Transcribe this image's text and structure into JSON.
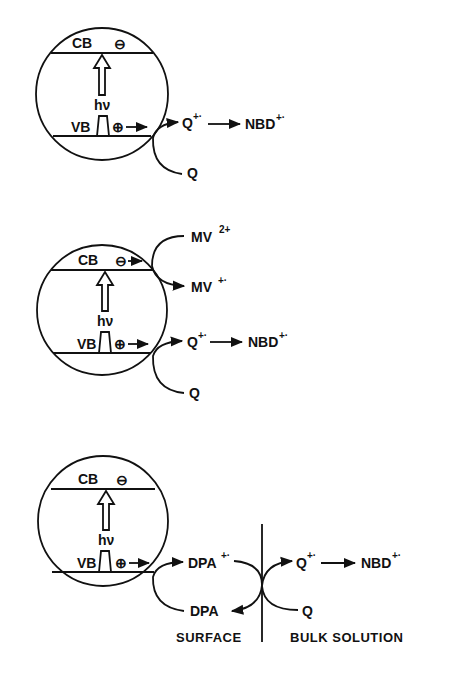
{
  "diagram": {
    "type": "photocatalysis-band-scheme",
    "panels": [
      {
        "id": "panel-1",
        "particle": {
          "cb_label": "CB",
          "vb_label": "VB",
          "electron": "⊖",
          "hole": "⊕",
          "excitation": "hν"
        },
        "hole_transfer": {
          "reactant": "Q",
          "product": "Q",
          "product_sup": "+·",
          "next": "NBD",
          "next_sup": "+·"
        }
      },
      {
        "id": "panel-2",
        "particle": {
          "cb_label": "CB",
          "vb_label": "VB",
          "electron": "⊖",
          "hole": "⊕",
          "excitation": "hν"
        },
        "electron_transfer": {
          "reactant": "MV",
          "reactant_sup": "2+",
          "product": "MV",
          "product_sup": "+·"
        },
        "hole_transfer": {
          "reactant": "Q",
          "product": "Q",
          "product_sup": "+·",
          "next": "NBD",
          "next_sup": "+·"
        }
      },
      {
        "id": "panel-3",
        "particle": {
          "cb_label": "CB",
          "vb_label": "VB",
          "electron": "⊖",
          "hole": "⊕",
          "excitation": "hν"
        },
        "surface_transfer": {
          "product": "DPA",
          "product_sup": "+·",
          "regenerated": "DPA"
        },
        "bulk_transfer": {
          "reactant": "Q",
          "product": "Q",
          "product_sup": "+·",
          "next": "NBD",
          "next_sup": "+·"
        },
        "regions": {
          "left": "SURFACE",
          "right": "BULK SOLUTION"
        }
      }
    ]
  }
}
